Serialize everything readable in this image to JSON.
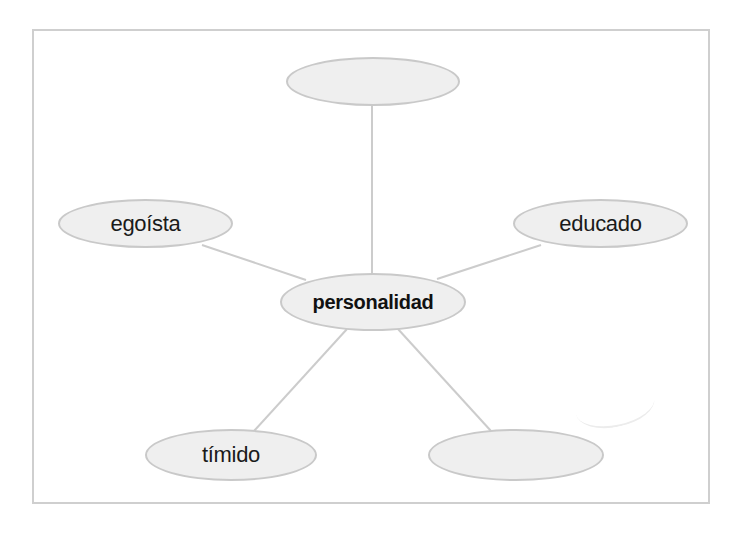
{
  "diagram": {
    "type": "word-web",
    "center": {
      "label": "personalidad"
    },
    "nodes": [
      {
        "id": "top",
        "label": ""
      },
      {
        "id": "left",
        "label": "egoísta"
      },
      {
        "id": "right",
        "label": "educado"
      },
      {
        "id": "bottom-left",
        "label": "tímido"
      },
      {
        "id": "bottom-right",
        "label": ""
      }
    ],
    "colors": {
      "node_fill": "#efefef",
      "node_border": "#c9c9c9",
      "link": "#cccccc",
      "frame": "#cfcfcf",
      "text": "#1a1a1a"
    }
  }
}
